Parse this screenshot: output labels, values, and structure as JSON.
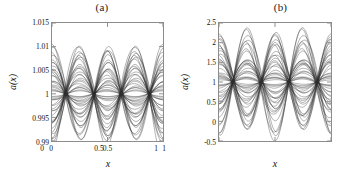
{
  "figure": {
    "background": "#ffffff",
    "curve_color": "#2b2b2b",
    "axis_color": "#8c8c8c"
  },
  "chart_data": [
    {
      "type": "line",
      "panel_id": "a",
      "title": "(a)",
      "xlabel": "x",
      "ylabel": "a(x)",
      "xlim": [
        0,
        1
      ],
      "ylim": [
        0.99,
        1.015
      ],
      "xticks": [
        0,
        0.5,
        1
      ],
      "xticklabels": [
        "0",
        "0.5",
        "1"
      ],
      "yticks": [
        0.99,
        0.995,
        1,
        1.005,
        1.01,
        1.015
      ],
      "yticklabels": [
        "0.99",
        "0.995",
        "1",
        "1.005",
        "1.01",
        "1.015"
      ],
      "grid": false,
      "legend": "none",
      "n_curves": 46,
      "description": "Family of oscillating curves a(x) clustered about 1, pinching to nodes at x=0.25 and x=0.75, anti-nodes at x=0, 0.5, 1.",
      "baseline": 1.0,
      "node_positions": [
        0.25,
        0.75
      ],
      "antinode_positions": [
        0,
        0.5,
        1
      ],
      "amplitude_min": 0.0005,
      "amplitude_max": 0.0105,
      "envelope_upper_at_half": 1.0105,
      "envelope_lower_at_half": 0.9908,
      "envelope_upper_at_zero": 1.0112,
      "envelope_lower_at_zero": 0.9925
    },
    {
      "type": "line",
      "panel_id": "b",
      "title": "(b)",
      "xlabel": "x",
      "ylabel": "a(x)",
      "xlim": [
        0,
        1
      ],
      "ylim": [
        -0.5,
        2.5
      ],
      "xticks": [
        0,
        0.5,
        1
      ],
      "xticklabels": [
        "0",
        "0.5",
        "1"
      ],
      "yticks": [
        -0.5,
        0,
        0.5,
        1,
        1.5,
        2,
        2.5
      ],
      "yticklabels": [
        "-0.5",
        "0",
        "0.5",
        "1",
        "1.5",
        "2",
        "2.5"
      ],
      "grid": false,
      "legend": "none",
      "n_curves": 46,
      "description": "Family of oscillating curves a(x) clustered about 1 with large amplitude, pinching to nodes at x=0.25 and x=0.75, anti-nodes at x=0, 0.5, 1.",
      "baseline": 1.0,
      "node_positions": [
        0.25,
        0.75
      ],
      "antinode_positions": [
        0,
        0.5,
        1
      ],
      "amplitude_min": 0.06,
      "amplitude_max": 1.3,
      "envelope_upper_at_half": 2.3,
      "envelope_lower_at_half": -0.05,
      "envelope_upper_at_zero": 2.15,
      "envelope_lower_at_zero": -0.25
    }
  ]
}
